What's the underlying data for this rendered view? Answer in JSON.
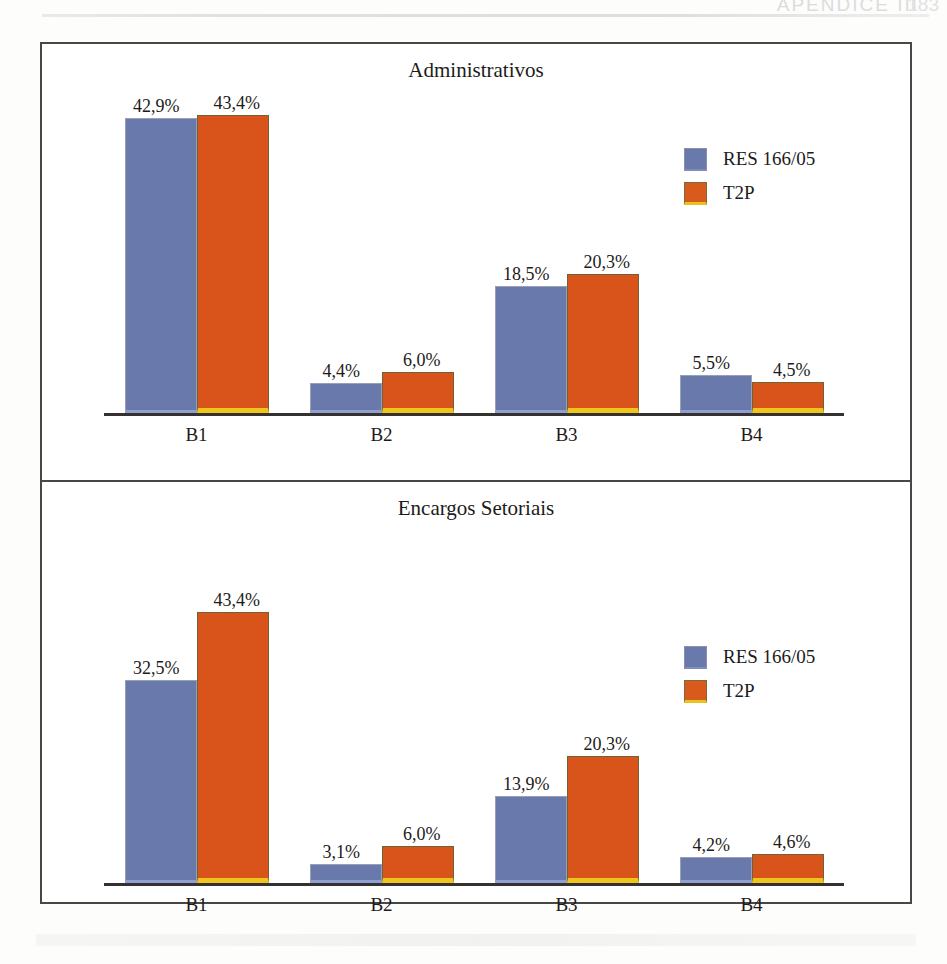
{
  "header": {
    "running_title": "APÊNDICE III",
    "page_number": "183"
  },
  "colors": {
    "series_blue": "#6a79ac",
    "series_orange": "#d9541b",
    "bar_base_gold": "#efc41c",
    "frame": "#4a4643",
    "text": "#1d1b1a"
  },
  "legend": {
    "series_blue_label": "RES 166/05",
    "series_orange_label": "T2P"
  },
  "chart_data": [
    {
      "type": "bar",
      "title": "Administrativos",
      "xlabel": "",
      "ylabel": "",
      "ylim": [
        0,
        45
      ],
      "grid": false,
      "legend_position": "top-right",
      "categories": [
        "B1",
        "B2",
        "B3",
        "B4"
      ],
      "series": [
        {
          "name": "RES 166/05",
          "color": "#6a79ac",
          "values": [
            42.9,
            4.4,
            18.5,
            5.5
          ],
          "labels": [
            "42,9%",
            "4,4%",
            "18,5%",
            "5,5%"
          ]
        },
        {
          "name": "T2P",
          "color": "#d9541b",
          "values": [
            43.4,
            6.0,
            20.3,
            4.5
          ],
          "labels": [
            "43,4%",
            "6,0%",
            "20,3%",
            "4,5%"
          ]
        }
      ]
    },
    {
      "type": "bar",
      "title": "Encargos Setoriais",
      "xlabel": "",
      "ylabel": "",
      "ylim": [
        0,
        45
      ],
      "grid": false,
      "legend_position": "top-right",
      "categories": [
        "B1",
        "B2",
        "B3",
        "B4"
      ],
      "series": [
        {
          "name": "RES 166/05",
          "color": "#6a79ac",
          "values": [
            32.5,
            3.1,
            13.9,
            4.2
          ],
          "labels": [
            "32,5%",
            "3,1%",
            "13,9%",
            "4,2%"
          ]
        },
        {
          "name": "T2P",
          "color": "#d9541b",
          "values": [
            43.4,
            6.0,
            20.3,
            4.6
          ],
          "labels": [
            "43,4%",
            "6,0%",
            "20,3%",
            "4,6%"
          ]
        }
      ]
    }
  ]
}
